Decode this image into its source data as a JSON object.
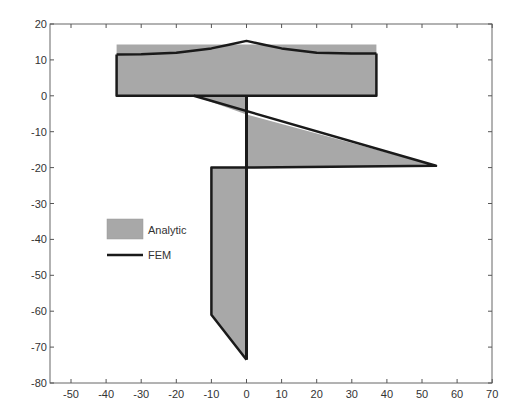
{
  "chart_data": {
    "type": "area",
    "title": "",
    "xlabel": "",
    "ylabel": "",
    "xlim": [
      -56,
      70
    ],
    "ylim": [
      -80,
      20
    ],
    "grid": false,
    "legend_position": "left-middle inside",
    "x_ticks": [
      -50,
      -40,
      -30,
      -20,
      -10,
      0,
      10,
      20,
      30,
      40,
      50,
      60,
      70
    ],
    "x_tick_labels": [
      "-50",
      "-40",
      "-30",
      "-20",
      "-10",
      "0",
      "10",
      "20",
      "30",
      "40",
      "50",
      "60",
      "70"
    ],
    "y_ticks": [
      20,
      10,
      0,
      -10,
      -20,
      -30,
      -40,
      -50,
      -60,
      -70,
      -80
    ],
    "y_tick_labels": [
      "20",
      "10",
      "0",
      "-10",
      "-20",
      "-30",
      "-40",
      "-50",
      "-60",
      "-70",
      "-80"
    ],
    "legend": [
      {
        "label": "Analytic",
        "style": "filled-patch",
        "color": "#a8a8a8"
      },
      {
        "label": "FEM",
        "style": "line",
        "color": "#1a1a1a"
      }
    ],
    "series": [
      {
        "name": "Analytic",
        "kind": "filled-polygons",
        "color": "#a8a8a8",
        "polygons": [
          {
            "part": "flange",
            "points": [
              [
                -37,
                0
              ],
              [
                -37,
                14.3
              ],
              [
                37,
                14.3
              ],
              [
                37,
                0
              ]
            ]
          },
          {
            "part": "web-upper-left",
            "points": [
              [
                -15,
                0
              ],
              [
                0,
                0
              ],
              [
                0,
                -5.2
              ]
            ]
          },
          {
            "part": "web-upper-right",
            "points": [
              [
                0,
                -5.2
              ],
              [
                54,
                -19.5
              ],
              [
                0,
                -20
              ]
            ]
          },
          {
            "part": "web-lower",
            "points": [
              [
                -10,
                -20
              ],
              [
                0,
                -20
              ],
              [
                0,
                -73.5
              ],
              [
                -10,
                -61
              ]
            ]
          }
        ]
      },
      {
        "name": "FEM",
        "kind": "lines",
        "color": "#1a1a1a",
        "lines": [
          {
            "part": "flange-top",
            "points": [
              [
                -37,
                11.5
              ],
              [
                -30,
                11.6
              ],
              [
                -20,
                12
              ],
              [
                -10,
                13.2
              ],
              [
                -5,
                14.2
              ],
              [
                0,
                15.3
              ],
              [
                5,
                14.2
              ],
              [
                10,
                13.2
              ],
              [
                20,
                12
              ],
              [
                30,
                11.8
              ],
              [
                37,
                11.8
              ]
            ]
          },
          {
            "part": "flange-outline",
            "points": [
              [
                -37,
                11.5
              ],
              [
                -37,
                0
              ],
              [
                37,
                0
              ],
              [
                37,
                11.8
              ]
            ]
          },
          {
            "part": "web-diagonal",
            "points": [
              [
                -15,
                0
              ],
              [
                54,
                -19.5
              ],
              [
                0,
                -20
              ]
            ]
          },
          {
            "part": "web-center",
            "points": [
              [
                0,
                0
              ],
              [
                0,
                -73.5
              ]
            ]
          },
          {
            "part": "web-lower-outline",
            "points": [
              [
                0,
                -20
              ],
              [
                -10,
                -20
              ],
              [
                -10,
                -61
              ],
              [
                0,
                -73.5
              ]
            ]
          }
        ]
      }
    ]
  },
  "axes": {
    "x_tick_labels": [
      "-50",
      "-40",
      "-30",
      "-20",
      "-10",
      "0",
      "10",
      "20",
      "30",
      "40",
      "50",
      "60",
      "70"
    ],
    "y_tick_labels": [
      "20",
      "10",
      "0",
      "-10",
      "-20",
      "-30",
      "-40",
      "-50",
      "-60",
      "-70",
      "-80"
    ]
  },
  "legend": {
    "analytic_label": "Analytic",
    "fem_label": "FEM"
  },
  "colors": {
    "fill": "#a8a8a8",
    "line": "#1a1a1a",
    "axis": "#555555"
  }
}
